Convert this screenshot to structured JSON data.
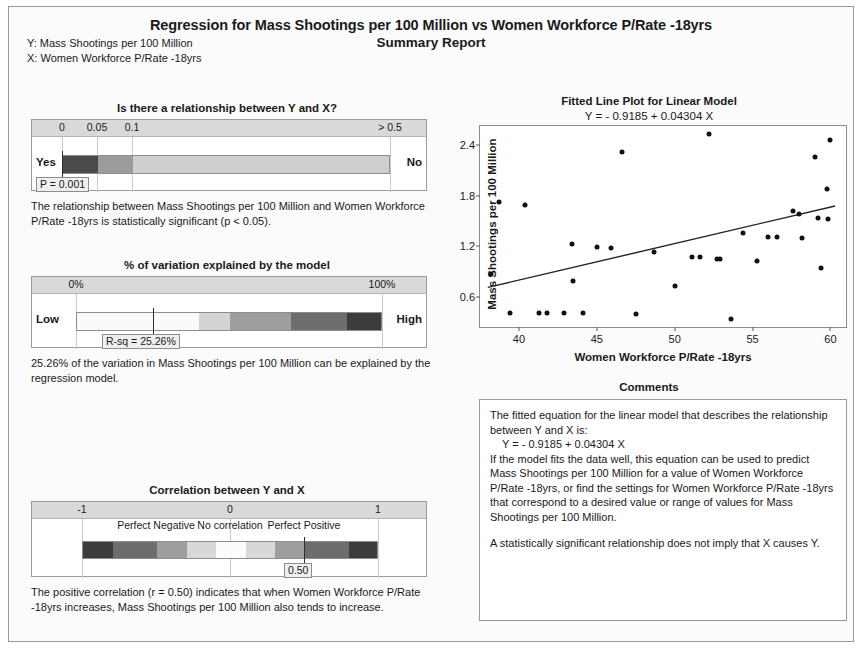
{
  "header": {
    "title": "Regression for Mass Shootings per 100 Million vs Women Workforce P/Rate -18yrs",
    "subtitle": "Summary Report",
    "y_variable": "Y: Mass Shootings per 100 Million",
    "x_variable": "X: Women Workforce P/Rate -18yrs"
  },
  "pvalue_panel": {
    "title": "Is there a relationship between Y and X?",
    "ticks": [
      "0",
      "0.05",
      "0.1",
      "> 0.5"
    ],
    "left_label": "Yes",
    "right_label": "No",
    "callout": "P = 0.001",
    "p_value": 0.001,
    "interpretation": "The relationship between Mass Shootings per 100 Million and Women Workforce P/Rate -18yrs is statistically significant (p < 0.05)."
  },
  "rsq_panel": {
    "title": "% of variation explained by the model",
    "tick_left": "0%",
    "tick_right": "100%",
    "left_label": "Low",
    "right_label": "High",
    "callout": "R-sq = 25.26%",
    "r_squared": 25.26,
    "interpretation": "25.26% of the variation in Mass Shootings per 100 Million can be explained by the regression model."
  },
  "correlation_panel": {
    "title": "Correlation between Y and X",
    "ticks": [
      "-1",
      "0",
      "1"
    ],
    "descriptions": [
      "Perfect Negative",
      "No correlation",
      "Perfect Positive"
    ],
    "callout": "0.50",
    "r_value": 0.5,
    "interpretation": "The positive correlation (r = 0.50) indicates that when Women Workforce P/Rate -18yrs increases, Mass Shootings per 100 Million also tends to increase."
  },
  "comments": {
    "title": "Comments",
    "lines": [
      "The fitted equation for the linear model that describes the relationship between Y and X is:",
      "Y = - 0.9185 + 0.04304 X",
      "If the model fits the data well, this equation can be used to predict Mass Shootings per 100 Million for a value of Women Workforce P/Rate -18yrs, or find the settings for Women Workforce P/Rate -18yrs that correspond to a desired value or range of values for Mass Shootings per 100 Million.",
      "A statistically significant relationship does not imply that X causes Y."
    ]
  },
  "chart_data": {
    "type": "scatter",
    "title": "Fitted Line Plot for Linear Model",
    "subtitle": "Y = - 0.9185 + 0.04304 X",
    "xlabel": "Women Workforce P/Rate -18yrs",
    "ylabel": "Mass Shootings per 100 Million",
    "xlim": [
      37.5,
      61.0
    ],
    "ylim": [
      0.25,
      2.62
    ],
    "xticks": [
      40,
      45,
      50,
      55,
      60
    ],
    "yticks": [
      0.6,
      1.2,
      1.8,
      2.4
    ],
    "grid": false,
    "legend": false,
    "fit_line": {
      "intercept": -0.9185,
      "slope": 0.04304,
      "x_start": 38.0,
      "x_end": 60.3
    },
    "points": [
      {
        "x": 38.2,
        "y": 0.87
      },
      {
        "x": 38.7,
        "y": 1.72
      },
      {
        "x": 39.4,
        "y": 0.42
      },
      {
        "x": 40.4,
        "y": 1.69
      },
      {
        "x": 41.3,
        "y": 0.42
      },
      {
        "x": 41.8,
        "y": 0.42
      },
      {
        "x": 42.9,
        "y": 0.42
      },
      {
        "x": 43.4,
        "y": 1.23
      },
      {
        "x": 43.5,
        "y": 0.79
      },
      {
        "x": 44.1,
        "y": 0.41
      },
      {
        "x": 45.0,
        "y": 1.19
      },
      {
        "x": 45.9,
        "y": 1.18
      },
      {
        "x": 46.6,
        "y": 2.31
      },
      {
        "x": 47.5,
        "y": 0.4
      },
      {
        "x": 48.7,
        "y": 1.13
      },
      {
        "x": 50.0,
        "y": 0.73
      },
      {
        "x": 51.1,
        "y": 1.08
      },
      {
        "x": 51.6,
        "y": 1.07
      },
      {
        "x": 52.2,
        "y": 2.53
      },
      {
        "x": 52.7,
        "y": 1.05
      },
      {
        "x": 52.9,
        "y": 1.05
      },
      {
        "x": 53.6,
        "y": 0.35
      },
      {
        "x": 54.4,
        "y": 1.36
      },
      {
        "x": 55.3,
        "y": 1.03
      },
      {
        "x": 56.0,
        "y": 1.31
      },
      {
        "x": 56.6,
        "y": 1.31
      },
      {
        "x": 57.6,
        "y": 1.62
      },
      {
        "x": 58.0,
        "y": 1.58
      },
      {
        "x": 58.2,
        "y": 1.3
      },
      {
        "x": 59.0,
        "y": 2.25
      },
      {
        "x": 59.2,
        "y": 1.54
      },
      {
        "x": 59.4,
        "y": 0.94
      },
      {
        "x": 59.8,
        "y": 1.88
      },
      {
        "x": 59.85,
        "y": 1.52
      },
      {
        "x": 60.0,
        "y": 2.45
      }
    ]
  }
}
